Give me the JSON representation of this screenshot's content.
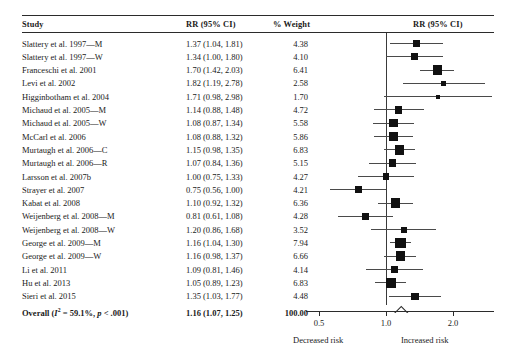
{
  "headers": {
    "study": "Study",
    "rr": "RR (95% CI)",
    "weight": "% Weight",
    "plot": "RR (95% CI)"
  },
  "axis": {
    "ticks": [
      "0.5",
      "1.0",
      "2.0"
    ],
    "tick_values": [
      0.5,
      1.0,
      2.0
    ],
    "null_value": "1.0",
    "left_label": "Decreased risk",
    "right_label": "Increased risk",
    "scale": "log"
  },
  "overall": {
    "label": "Overall (I2 = 59.1%, p < .001)",
    "label_prefix": "Overall (",
    "i_symbol": "I",
    "i_exponent": "2",
    "i_value": " = 59.1%, ",
    "p_symbol": "p",
    "p_value": " < .001)",
    "rr": "1.16 (1.07, 1.25)",
    "weight": "100.00"
  },
  "colors": {
    "marker": "#111111",
    "line": "#4a4a4a",
    "rule": "#2b2b2b",
    "diamond_fill": "#ffffff",
    "text": "#1a1a1a"
  },
  "chart_data": {
    "type": "forest",
    "title": "RR (95% CI)",
    "xlabel": "",
    "ylabel": "",
    "xscale": "log",
    "xlim": [
      0.4,
      2.8
    ],
    "xticks": [
      0.5,
      1.0,
      2.0
    ],
    "null_line": 1.0,
    "columns": [
      "Study",
      "RR (95% CI)",
      "% Weight"
    ],
    "rows": [
      {
        "study": "Slattery et al. 1997—M",
        "rr_text": "1.37 (1.04, 1.81)",
        "est": 1.37,
        "lo": 1.04,
        "hi": 1.81,
        "weight_text": "4.38",
        "weight": 4.38
      },
      {
        "study": "Slattery et al. 1997—W",
        "rr_text": "1.34 (1.00, 1.80)",
        "est": 1.34,
        "lo": 1.0,
        "hi": 1.8,
        "weight_text": "4.10",
        "weight": 4.1
      },
      {
        "study": "Franceschi et al. 2001",
        "rr_text": "1.70 (1.42, 2.03)",
        "est": 1.7,
        "lo": 1.42,
        "hi": 2.03,
        "weight_text": "6.41",
        "weight": 6.41
      },
      {
        "study": "Levi et al. 2002",
        "rr_text": "1.82 (1.19, 2.78)",
        "est": 1.82,
        "lo": 1.19,
        "hi": 2.78,
        "weight_text": "2.58",
        "weight": 2.58
      },
      {
        "study": "Higginbotham et al. 2004",
        "rr_text": "1.71 (0.98, 2.98)",
        "est": 1.71,
        "lo": 0.98,
        "hi": 2.98,
        "weight_text": "1.70",
        "weight": 1.7
      },
      {
        "study": "Michaud et al. 2005—M",
        "rr_text": "1.14 (0.88, 1.48)",
        "est": 1.14,
        "lo": 0.88,
        "hi": 1.48,
        "weight_text": "4.72",
        "weight": 4.72
      },
      {
        "study": "Michaud et al. 2005—W",
        "rr_text": "1.08 (0.87, 1.34)",
        "est": 1.08,
        "lo": 0.87,
        "hi": 1.34,
        "weight_text": "5.58",
        "weight": 5.58
      },
      {
        "study": "McCarl et al. 2006",
        "rr_text": "1.08 (0.88, 1.32)",
        "est": 1.08,
        "lo": 0.88,
        "hi": 1.32,
        "weight_text": "5.86",
        "weight": 5.86
      },
      {
        "study": "Murtaugh et al. 2006—C",
        "rr_text": "1.15 (0.98, 1.35)",
        "est": 1.15,
        "lo": 0.98,
        "hi": 1.35,
        "weight_text": "6.83",
        "weight": 6.83
      },
      {
        "study": "Murtaugh et al. 2006—R",
        "rr_text": "1.07 (0.84, 1.36)",
        "est": 1.07,
        "lo": 0.84,
        "hi": 1.36,
        "weight_text": "5.15",
        "weight": 5.15
      },
      {
        "study": "Larsson et al. 2007b",
        "rr_text": "1.00 (0.75, 1.33)",
        "est": 1.0,
        "lo": 0.75,
        "hi": 1.33,
        "weight_text": "4.27",
        "weight": 4.27
      },
      {
        "study": "Strayer et al. 2007",
        "rr_text": "0.75 (0.56, 1.00)",
        "est": 0.75,
        "lo": 0.56,
        "hi": 1.0,
        "weight_text": "4.21",
        "weight": 4.21
      },
      {
        "study": "Kabat et al. 2008",
        "rr_text": "1.10 (0.92, 1.32)",
        "est": 1.1,
        "lo": 0.92,
        "hi": 1.32,
        "weight_text": "6.36",
        "weight": 6.36
      },
      {
        "study": "Weijenberg et al. 2008—M",
        "rr_text": "0.81 (0.61, 1.08)",
        "est": 0.81,
        "lo": 0.61,
        "hi": 1.08,
        "weight_text": "4.28",
        "weight": 4.28
      },
      {
        "study": "Weijenberg et al. 2008—W",
        "rr_text": "1.20 (0.86, 1.68)",
        "est": 1.2,
        "lo": 0.86,
        "hi": 1.68,
        "weight_text": "3.52",
        "weight": 3.52
      },
      {
        "study": "George et al. 2009—M",
        "rr_text": "1.16 (1.04, 1.30)",
        "est": 1.16,
        "lo": 1.04,
        "hi": 1.3,
        "weight_text": "7.94",
        "weight": 7.94
      },
      {
        "study": "George et al. 2009—W",
        "rr_text": "1.16 (0.98, 1.37)",
        "est": 1.16,
        "lo": 0.98,
        "hi": 1.37,
        "weight_text": "6.66",
        "weight": 6.66
      },
      {
        "study": "Li et al. 2011",
        "rr_text": "1.09 (0.81, 1.46)",
        "est": 1.09,
        "lo": 0.81,
        "hi": 1.46,
        "weight_text": "4.14",
        "weight": 4.14
      },
      {
        "study": "Hu et al. 2013",
        "rr_text": "1.05 (0.89, 1.23)",
        "est": 1.05,
        "lo": 0.89,
        "hi": 1.23,
        "weight_text": "6.83",
        "weight": 6.83
      },
      {
        "study": "Sieri et al. 2015",
        "rr_text": "1.35 (1.03, 1.77)",
        "est": 1.35,
        "lo": 1.03,
        "hi": 1.77,
        "weight_text": "4.48",
        "weight": 4.48
      }
    ],
    "summary": {
      "study": "Overall (I2 = 59.1%, p < .001)",
      "rr_text": "1.16 (1.07, 1.25)",
      "est": 1.16,
      "lo": 1.07,
      "hi": 1.25,
      "weight_text": "100.00",
      "weight": 100.0
    },
    "heterogeneity": {
      "i_squared_pct": 59.1,
      "p_text": "< .001"
    },
    "legend": [],
    "annotations": [
      "Decreased risk",
      "Increased risk"
    ]
  }
}
